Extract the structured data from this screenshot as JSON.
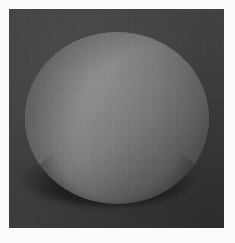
{
  "scene": {
    "title": "Rendered Sphere",
    "subject": "sphere",
    "shading": "faceted-gouraud",
    "canvas": {
      "width": 235,
      "height": 243,
      "background_color": "#fbfbfb"
    },
    "panel": {
      "label": "render-viewport",
      "x": 9,
      "y": 9,
      "width": 215,
      "height": 219,
      "background_color": "#3e3e3e",
      "noise": "film-grain"
    },
    "sphere": {
      "label": "sphere",
      "center_x": 116,
      "center_y": 117,
      "radius_x": 92,
      "radius_y": 86,
      "highlight_color": "#8e8e8e",
      "midtone_color": "#707070",
      "terminator_color": "#474747",
      "limb_color": "#343434",
      "facet_count_visible": "quad-mesh"
    },
    "light": {
      "label": "key-light",
      "direction": "upper-left",
      "azimuth_deg": 315,
      "elevation_deg": 55
    },
    "shadow": {
      "label": "contact-shadow",
      "x": 22,
      "y": 150,
      "width": 172,
      "height": 56,
      "color": "#000000",
      "opacity": 0.72
    }
  }
}
